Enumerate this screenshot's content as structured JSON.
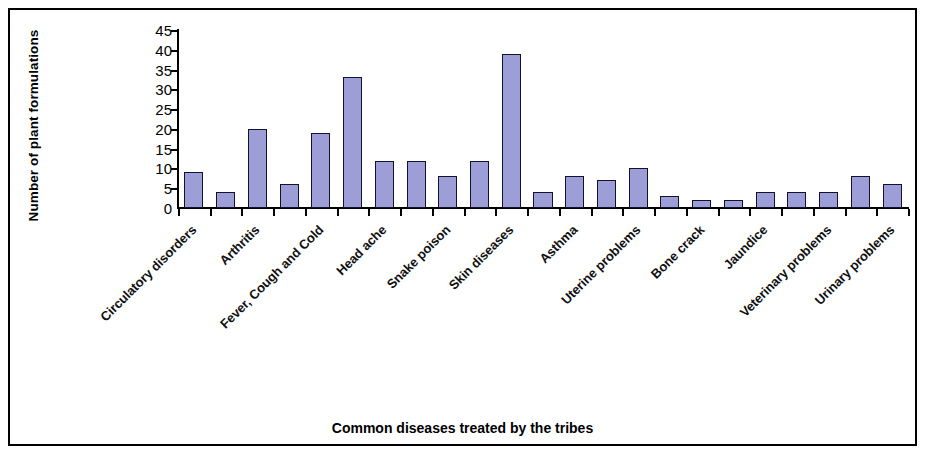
{
  "chart_data": {
    "type": "bar",
    "title": "",
    "xlabel": "Common diseases treated by the tribes",
    "ylabel": "Number of plant formulations",
    "ylim": [
      0,
      45
    ],
    "ytick_step": 5,
    "yticks": [
      "0",
      "5",
      "10",
      "15",
      "20",
      "25",
      "30",
      "35",
      "40",
      "45"
    ],
    "grid": false,
    "legend": false,
    "bar_fill_color": "#9d9dd8",
    "bar_border_color": "#12122c",
    "label_interval": 2,
    "categories": [
      "Circulatory disorders",
      "",
      "Arthritis",
      "",
      "Fever, Cough and Cold",
      "",
      "Head ache",
      "",
      "Snake poison",
      "",
      "Skin diseases",
      "",
      "Asthma",
      "",
      "Uterine problems",
      "",
      "Bone crack",
      "",
      "Jaundice",
      "",
      "Veterinary problems",
      "",
      "Urinary problems"
    ],
    "visible_tick_labels": [
      "Circulatory disorders",
      "Arthritis",
      "Fever, Cough and Cold",
      "Head ache",
      "Snake poison",
      "Skin diseases",
      "Asthma",
      "Uterine problems",
      "Bone crack",
      "Jaundice",
      "Veterinary problems",
      "Urinary problems"
    ],
    "values": [
      9,
      4,
      20,
      6,
      19,
      33,
      12,
      12,
      8,
      12,
      39,
      4,
      8,
      7,
      10,
      3,
      2,
      2,
      4,
      4,
      4,
      8,
      6
    ]
  }
}
